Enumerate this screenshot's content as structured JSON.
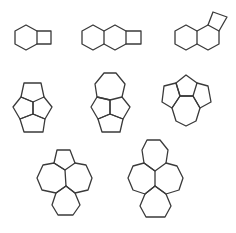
{
  "figure": {
    "background": "#ffffff",
    "stroke_color": "#3a3a3a",
    "structures": [
      {
        "id": "s1",
        "description": "hexagon fused with four-membered ring",
        "rings": [
          "6",
          "4"
        ],
        "paths": [
          "M15,31 L26,25 L37,31 L37,44 L26,50 L15,44 Z",
          "M37,31 L51,31 L51,44 L37,44"
        ]
      },
      {
        "id": "s2",
        "description": "two fused hexagons with terminal four-membered ring",
        "rings": [
          "6",
          "6",
          "4"
        ],
        "paths": [
          "M82,31 L93,25 L104,31 L104,44 L93,50 L82,44 Z",
          "M104,31 L115,25 L126,31 L126,44 L115,50 L104,44",
          "M126,31 L141,31 L141,44 L126,44"
        ]
      },
      {
        "id": "s3",
        "description": "two fused hexagons with angular four-membered ring",
        "rings": [
          "6",
          "6",
          "4"
        ],
        "paths": [
          "M175,31 L186,25 L197,31 L197,44 L186,50 L175,44 Z",
          "M197,31 L208,25 L219,31 L219,44 L208,50 L197,44",
          "M208,25 L213,12 L227,17 L219,31"
        ]
      },
      {
        "id": "s4",
        "description": "tetraquinane-like cage of four pentagons",
        "rings": [
          "5",
          "5",
          "5",
          "5"
        ],
        "paths": [
          "M24,83 L41,83 L44,97 L33,102 L21,97 Z",
          "M21,97 L33,102 L33,114 L20,119 L13,107 Z",
          "M44,97 L52,107 L45,119 L33,114 L33,102",
          "M20,119 L33,114 L45,119 L43,132 L24,132 Z"
        ]
      },
      {
        "id": "s5",
        "description": "heptagon over three fused pentagons",
        "rings": [
          "7",
          "5",
          "5",
          "5"
        ],
        "paths": [
          "M104,73 L116,73 L125,84 L122,97 L110,100 L97,97 L95,84 Z",
          "M97,97 L110,100 L110,114 L98,119 L91,107 Z",
          "M122,97 L130,107 L123,119 L110,114 L110,100",
          "M98,119 L110,114 L123,119 L120,132 L102,132 Z"
        ]
      },
      {
        "id": "s6",
        "description": "three pentagons over a heptagon",
        "rings": [
          "5",
          "5",
          "5",
          "7"
        ],
        "paths": [
          "M186,75 L197,83 L193,96 L180,96 L176,83 Z",
          "M176,83 L180,96 L172,108 L162,102 L164,86 Z",
          "M197,83 L208,86 L211,102 L200,108 L193,96",
          "M172,108 L180,96 L193,96 L200,108 L196,121 L186,126 L176,121 Z"
        ]
      },
      {
        "id": "s7",
        "description": "pentagon and three larger rings around a central atom",
        "rings": [
          "5",
          "7",
          "7",
          "6"
        ],
        "paths": [
          "M57,150 L70,150 L75,163 L65,170 L54,163 Z",
          "M54,163 L65,170 L66,186 L56,193 L42,190 L37,178 L43,165 Z",
          "M75,163 L86,165 L92,178 L88,190 L75,193 L66,186",
          "M56,193 L66,186 L75,193 L80,205 L73,215 L58,215 L52,205 Z"
        ]
      },
      {
        "id": "s8",
        "description": "four heptagons around a central atom",
        "rings": [
          "7",
          "7",
          "7",
          "7"
        ],
        "paths": [
          "M147,140 L160,140 L168,150 L166,163 L155,171 L144,163 L142,150 Z",
          "M144,163 L155,171 L155,186 L145,194 L133,190 L128,178 L133,166 Z",
          "M166,163 L177,166 L183,178 L179,190 L166,194 L155,186",
          "M145,194 L155,186 L166,194 L171,206 L165,217 L146,217 L140,206 Z"
        ]
      }
    ]
  }
}
